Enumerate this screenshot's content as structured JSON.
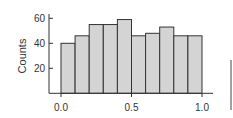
{
  "chart_data": {
    "type": "bar",
    "title": "",
    "xlabel": "",
    "ylabel": "Counts",
    "bin_edges": [
      0.0,
      0.1,
      0.2,
      0.3,
      0.4,
      0.5,
      0.6,
      0.7,
      0.8,
      0.9,
      1.0
    ],
    "categories": [
      "0.0-0.1",
      "0.1-0.2",
      "0.2-0.3",
      "0.3-0.4",
      "0.4-0.5",
      "0.5-0.6",
      "0.6-0.7",
      "0.7-0.8",
      "0.8-0.9",
      "0.9-1.0"
    ],
    "values": [
      40,
      46,
      55,
      55,
      59,
      46,
      48,
      53,
      46,
      46
    ],
    "xlim": [
      -0.05,
      1.08
    ],
    "ylim": [
      0,
      66
    ],
    "x_ticks": [
      "0.0",
      "0.5",
      "1.0"
    ],
    "y_ticks": [
      "20",
      "40",
      "60"
    ],
    "grid": false,
    "legend": null,
    "bar_color": "#d4d4d4",
    "edge_color": "#333333"
  }
}
